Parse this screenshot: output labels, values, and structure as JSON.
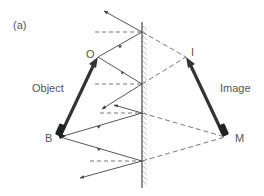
{
  "figure": {
    "panel_label": "(a)",
    "object_label": "Object",
    "image_label": "Image",
    "points": {
      "object_top": "O",
      "object_bottom": "B",
      "image_top": "I",
      "image_bottom": "M"
    },
    "colors": {
      "line": "#444444",
      "dashed": "#666666",
      "arrow_body": "#333333",
      "hatch": "#aaaaaa",
      "text": "#555555"
    }
  }
}
